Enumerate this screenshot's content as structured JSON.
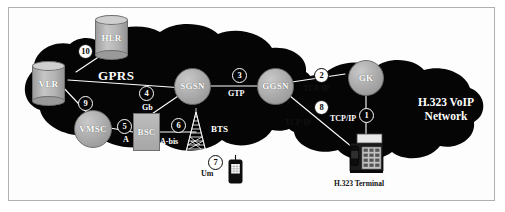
{
  "figure": {
    "background_color": "#ffffff",
    "frame_color": "#b0b0b0",
    "cloud_color": "#050505",
    "node_color": "#b0b0b0",
    "label_color": "#ffffff"
  },
  "clouds": [
    {
      "id": "gprs",
      "label": "GPRS"
    },
    {
      "id": "voip",
      "label_line1": "H.323 VoIP",
      "label_line2": "Network"
    }
  ],
  "nodes": [
    {
      "id": "hlr",
      "label": "HLR",
      "shape": "cylinder"
    },
    {
      "id": "vlr",
      "label": "VLR",
      "shape": "cylinder"
    },
    {
      "id": "vmsc",
      "label": "VMSC",
      "shape": "circle"
    },
    {
      "id": "sgsn",
      "label": "SGSN",
      "shape": "circle"
    },
    {
      "id": "ggsn",
      "label": "GGSN",
      "shape": "circle"
    },
    {
      "id": "gk",
      "label": "GK",
      "shape": "circle"
    },
    {
      "id": "bsc",
      "label": "BSC",
      "shape": "rectangle"
    },
    {
      "id": "bts",
      "label": "BTS",
      "shape": "antenna-tower"
    },
    {
      "id": "ms",
      "label": "",
      "shape": "mobile-handset"
    },
    {
      "id": "h323-terminal",
      "label": "H.323 Terminal",
      "shape": "desk-phone"
    }
  ],
  "badges": [
    {
      "n": "1",
      "style": "outline"
    },
    {
      "n": "2",
      "style": "filled"
    },
    {
      "n": "3",
      "style": "outline"
    },
    {
      "n": "4",
      "style": "outline"
    },
    {
      "n": "5",
      "style": "outline"
    },
    {
      "n": "6",
      "style": "outline"
    },
    {
      "n": "7",
      "style": "filled"
    },
    {
      "n": "8",
      "style": "filled"
    },
    {
      "n": "9",
      "style": "outline"
    },
    {
      "n": "10",
      "style": "filled"
    }
  ],
  "interface_labels": [
    {
      "id": "gtp",
      "text": "GTP"
    },
    {
      "id": "gb",
      "text": "Gb"
    },
    {
      "id": "a",
      "text": "A"
    },
    {
      "id": "abis",
      "text": "A-bis"
    },
    {
      "id": "um",
      "text": "Um"
    },
    {
      "id": "tcpip1",
      "text": "TCP/IP"
    },
    {
      "id": "tcpip2",
      "text": "TCP/IP"
    },
    {
      "id": "tcpip3",
      "text": "TCP/IP"
    }
  ]
}
